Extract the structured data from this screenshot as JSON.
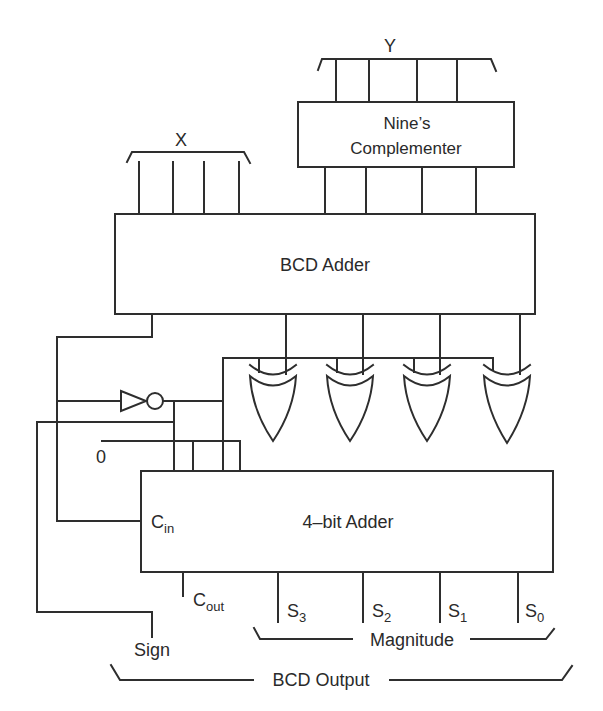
{
  "inputs": {
    "x_label": "X",
    "y_label": "Y"
  },
  "blocks": {
    "nines_complementer": {
      "line1": "Nine’s",
      "line2": "Complementer"
    },
    "bcd_adder": {
      "label": "BCD Adder"
    },
    "four_bit_adder": {
      "label": "4–bit Adder"
    }
  },
  "ports": {
    "cin": {
      "main": "C",
      "sub": "in"
    },
    "cout": {
      "main": "C",
      "sub": "out"
    },
    "zero": "0"
  },
  "outputs": {
    "sum_bits": [
      {
        "main": "S",
        "sub": "3"
      },
      {
        "main": "S",
        "sub": "2"
      },
      {
        "main": "S",
        "sub": "1"
      },
      {
        "main": "S",
        "sub": "0"
      }
    ],
    "sign": "Sign",
    "magnitude": "Magnitude",
    "bcd_output": "BCD Output"
  },
  "gates": {
    "inverter_count": 1,
    "xor_count": 4
  }
}
